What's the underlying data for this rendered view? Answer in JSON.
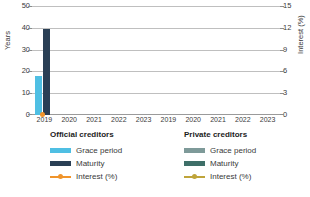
{
  "chart_data": {
    "type": "bar",
    "title": "",
    "xlabel": "",
    "ylabel": "Years",
    "y2label": "Interest (%)",
    "ylim": [
      0,
      50
    ],
    "yticks": [
      0,
      10,
      20,
      30,
      40,
      50
    ],
    "y2lim": [
      0,
      15
    ],
    "y2ticks": [
      0,
      3,
      6,
      9,
      12,
      15
    ],
    "grid": true,
    "legend_position": "bottom",
    "categories": [
      "2019",
      "2020",
      "2021",
      "2022",
      "2023"
    ],
    "panels": [
      {
        "name": "Official creditors",
        "series": [
          {
            "name": "Grace period",
            "axis": "left",
            "unit": "Years",
            "color": "#4FBFE3",
            "values": [
              18,
              0,
              0,
              0,
              0
            ]
          },
          {
            "name": "Maturity",
            "axis": "left",
            "unit": "Years",
            "color": "#2A3F55",
            "values": [
              40,
              0,
              0,
              0,
              0
            ]
          },
          {
            "name": "Interest (%)",
            "axis": "right",
            "unit": "%",
            "color": "#F0942B",
            "type": "line",
            "values": [
              0,
              null,
              null,
              null,
              null
            ]
          }
        ]
      },
      {
        "name": "Private creditors",
        "series": [
          {
            "name": "Grace period",
            "axis": "left",
            "unit": "Years",
            "color": "#7E9A99",
            "values": [
              0,
              0,
              0,
              0,
              0
            ]
          },
          {
            "name": "Maturity",
            "axis": "left",
            "unit": "Years",
            "color": "#3E6F68",
            "values": [
              0,
              0,
              0,
              0,
              0
            ]
          },
          {
            "name": "Interest (%)",
            "axis": "right",
            "unit": "%",
            "color": "#BFA43A",
            "type": "line",
            "values": [
              null,
              null,
              null,
              null,
              null
            ]
          }
        ]
      }
    ]
  },
  "axes": {
    "left": {
      "label": "Years",
      "ticks": [
        "50",
        "40",
        "30",
        "20",
        "10",
        "0"
      ]
    },
    "right": {
      "label": "Interest (%)",
      "ticks": [
        "15",
        "12",
        "9",
        "6",
        "3",
        "0"
      ]
    },
    "x_official": [
      "2019",
      "2020",
      "2021",
      "2022",
      "2023"
    ],
    "x_private": [
      "2019",
      "2020",
      "2021",
      "2022",
      "2023"
    ]
  },
  "legends": {
    "official": {
      "title": "Official creditors",
      "items": [
        {
          "label": "Grace period",
          "color": "#4FBFE3",
          "kind": "bar"
        },
        {
          "label": "Maturity",
          "color": "#2A3F55",
          "kind": "bar"
        },
        {
          "label": "Interest (%)",
          "color": "#F0942B",
          "kind": "line"
        }
      ]
    },
    "private": {
      "title": "Private creditors",
      "items": [
        {
          "label": "Grace period",
          "color": "#7E9A99",
          "kind": "bar"
        },
        {
          "label": "Maturity",
          "color": "#3E6F68",
          "kind": "bar"
        },
        {
          "label": "Interest (%)",
          "color": "#BFA43A",
          "kind": "line"
        }
      ]
    }
  }
}
